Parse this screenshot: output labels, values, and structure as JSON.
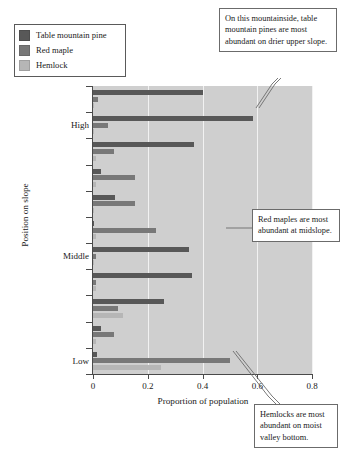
{
  "chart_data": {
    "type": "bar",
    "orientation": "horizontal",
    "title": "",
    "xlabel": "Proportion of population",
    "ylabel": "Position on slope",
    "xlim": [
      0,
      0.8
    ],
    "xticks": [
      0,
      0.2,
      0.4,
      0.6,
      0.8
    ],
    "xtick_labels": [
      "0",
      "0.2",
      "0.4",
      "0.6",
      "0.8"
    ],
    "ytick_labels": [
      "High",
      "Middle",
      "Low"
    ],
    "grid": "vertical-white-gridlines",
    "legend_position": "top-left-outside",
    "plot_background": "#cfcfcf",
    "categories": [
      "pos-1",
      "pos-2",
      "pos-3",
      "pos-4",
      "pos-5",
      "pos-6",
      "pos-7",
      "pos-8",
      "pos-9",
      "pos-10",
      "pos-11"
    ],
    "series": [
      {
        "name": "Table mountain pine",
        "color": "#585858",
        "values": [
          0.4,
          0.585,
          0.37,
          0.03,
          0.08,
          0.005,
          0.35,
          0.36,
          0.26,
          0.03,
          0.015
        ]
      },
      {
        "name": "Red maple",
        "color": "#787878",
        "values": [
          0.02,
          0.055,
          0.075,
          0.155,
          0.155,
          0.23,
          0.01,
          0.01,
          0.09,
          0.075,
          0.5
        ]
      },
      {
        "name": "Hemlock",
        "color": "#b6b6b6",
        "values": [
          0.005,
          0.005,
          0.01,
          0.01,
          0.005,
          0.01,
          0.005,
          0.01,
          0.11,
          0.01,
          0.25
        ]
      }
    ],
    "annotations": [
      "On this mountainside, table mountain pines are most abundant on drier upper slope.",
      "Red maples are most abundant at midslope.",
      "Hemlocks are most abundant on moist valley bottom."
    ]
  },
  "legend": {
    "items": [
      {
        "label": "Table mountain pine",
        "color": "#585858"
      },
      {
        "label": "Red maple",
        "color": "#787878"
      },
      {
        "label": "Hemlock",
        "color": "#b6b6b6"
      }
    ]
  },
  "axes": {
    "x_title": "Proportion of population",
    "y_title": "Position on slope",
    "x_tick_labels": [
      "0",
      "0.2",
      "0.4",
      "0.6",
      "0.8"
    ],
    "y_tick_labels": {
      "high": "High",
      "middle": "Middle",
      "low": "Low"
    }
  },
  "callouts": {
    "pine": "On this mountainside, table mountain pines are most abundant on drier upper slope.",
    "maple": "Red maples are most abundant at midslope.",
    "hemlock": "Hemlocks are most abundant on moist valley bottom."
  }
}
